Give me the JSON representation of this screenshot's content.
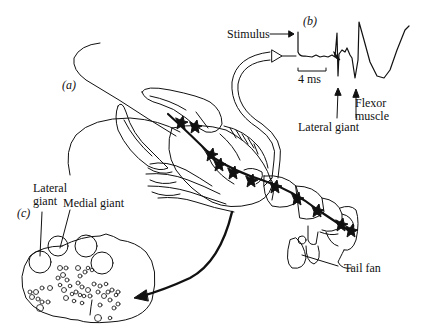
{
  "figure": {
    "panels": {
      "a": "(a)",
      "b": "(b)",
      "c": "(c)"
    },
    "labels": {
      "stimulus": "Stimulus",
      "scale_bar": "4  ms",
      "lateral_giant_b": "Lateral giant",
      "flexor_muscle_line1": "Flexor",
      "flexor_muscle_line2": "muscle",
      "lateral_giant_c_line1": "Lateral",
      "lateral_giant_c_line2": "giant",
      "medial_giant": "Medial giant",
      "tail_fan": "Tail fan"
    },
    "colors": {
      "ink": "#111111",
      "background": "#ffffff"
    }
  }
}
